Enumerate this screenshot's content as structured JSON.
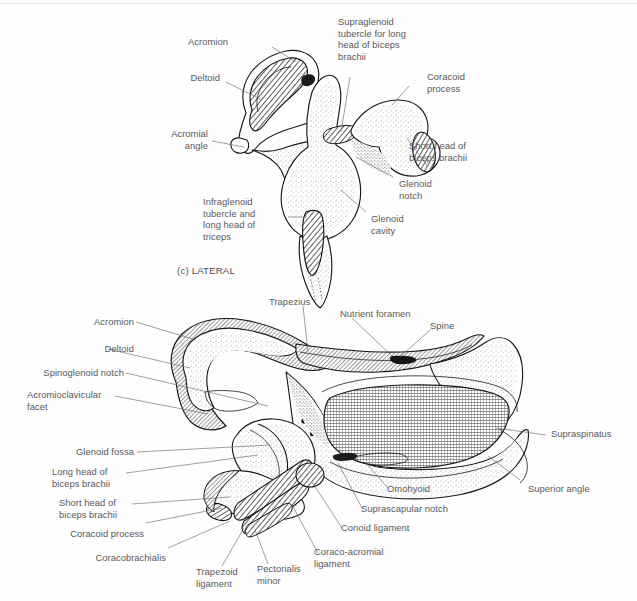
{
  "figure": {
    "kind": "anatomical-illustration",
    "subject": "Scapula",
    "panels": [
      {
        "id": "panel-c",
        "caption": "(c) LATERAL",
        "view": "lateral",
        "labels": [
          "Acromion",
          "Deltoid",
          "Acromial\nangle",
          "Infraglenoid\ntubercle and\nlong head of\ntriceps",
          "Supraglenoid\ntubercle for long\nhead of biceps\nbrachii",
          "Coracoid\nprocess",
          "Short head of\nbiceps brachii",
          "Glenoid\nnotch",
          "Glenoid\ncavity"
        ]
      },
      {
        "id": "panel-d",
        "caption": "",
        "view": "superior",
        "labels": [
          "Acromion",
          "Deltoid",
          "Spinoglenoid notch",
          "Acromioclavicular\nfacet",
          "Glenoid fossa",
          "Long head of\nbiceps brachii",
          "Short head of\nbiceps brachii",
          "Coracoid process",
          "Coracobrachialis",
          "Trapezoid\nligament",
          "Pectorialis\nminor",
          "Coraco-acromial\nligament",
          "Conoid ligament",
          "Suprascapular notch",
          "Omohyoid",
          "Trapezius",
          "Nutrient foramen",
          "Spine",
          "Supraspinatus",
          "Superior angle"
        ]
      }
    ]
  },
  "panel_c": {
    "caption": "(c) LATERAL",
    "l_acromion": "Acromion",
    "l_deltoid": "Deltoid",
    "l_acromial_angle": "Acromial\nangle",
    "l_infraglenoid": "Infraglenoid\ntubercle and\nlong head of\ntriceps",
    "l_supraglenoid": "Supraglenoid\ntubercle for long\nhead of biceps\nbrachii",
    "l_coracoid_process": "Coracoid\nprocess",
    "l_short_head": "Short head of\nbiceps brachii",
    "l_glenoid_notch": "Glenoid\nnotch",
    "l_glenoid_cavity": "Glenoid\ncavity"
  },
  "panel_d": {
    "l_acromion": "Acromion",
    "l_deltoid": "Deltoid",
    "l_spinoglenoid_notch": "Spinoglenoid notch",
    "l_acromioclavicular_facet": "Acromioclavicular\nfacet",
    "l_glenoid_fossa": "Glenoid fossa",
    "l_long_head": "Long head of\nbiceps brachii",
    "l_short_head": "Short head of\nbiceps brachii",
    "l_coracoid_process": "Coracoid process",
    "l_coracobrachialis": "Coracobrachialis",
    "l_trapezoid_ligament": "Trapezoid\nligament",
    "l_pectorialis_minor": "Pectorialis\nminor",
    "l_coraco_acromial_ligament": "Coraco-acromial\nligament",
    "l_conoid_ligament": "Conoid ligament",
    "l_suprascapular_notch": "Suprascapular notch",
    "l_omohyoid": "Omohyoid",
    "l_trapezius": "Trapezius",
    "l_nutrient_foramen": "Nutrient foramen",
    "l_spine": "Spine",
    "l_supraspinatus": "Supraspinatus",
    "l_superior_angle": "Superior angle"
  },
  "colors": {
    "page_background": "#fefefe",
    "ink": "#1a1a1a",
    "label_text": "#58585a",
    "leader_line": "#6b6b6d",
    "hatch_gray": "#8e8e8e",
    "fossa_fill": "#9a9a9a"
  }
}
